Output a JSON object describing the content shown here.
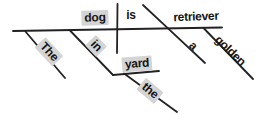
{
  "diagram": {
    "colors": {
      "background": "#ffffff",
      "line": "#222222",
      "text": "#161616",
      "highlight": "#d4d4d4"
    },
    "words": {
      "subject_article": {
        "text": "The",
        "highlighted": true
      },
      "subject": {
        "text": "dog",
        "highlighted": true
      },
      "preposition": {
        "text": "in",
        "highlighted": true
      },
      "prep_object_article": {
        "text": "the",
        "highlighted": true
      },
      "prep_object": {
        "text": "yard",
        "highlighted": true
      },
      "verb": {
        "text": "is",
        "highlighted": false
      },
      "pred_article": {
        "text": "a",
        "highlighted": false
      },
      "pred_adjective": {
        "text": "golden",
        "highlighted": false
      },
      "predicate_nominative": {
        "text": "retriever",
        "highlighted": false
      }
    }
  }
}
